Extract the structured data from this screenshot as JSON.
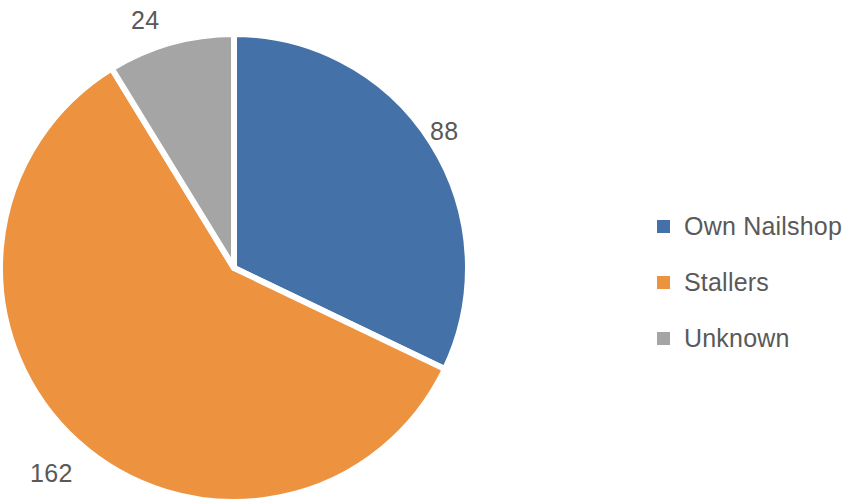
{
  "chart_data": {
    "type": "pie",
    "title": "",
    "subtitle": "",
    "xlabel": "",
    "ylabel": "",
    "categories": [
      "Own Nailshop",
      "Stallers",
      "Unknown"
    ],
    "values": [
      88,
      162,
      24
    ],
    "total": 274,
    "data_labels": [
      "88",
      "162",
      "24"
    ],
    "colors": [
      "#4472a8",
      "#ed9340",
      "#a5a5a5"
    ],
    "legend_position": "right",
    "grid": false,
    "start_angle_deg": 0,
    "direction": "clockwise",
    "slices": [
      {
        "name": "Own Nailshop",
        "value": 88,
        "label": "88",
        "color": "#4472a8",
        "percent": 32.1,
        "start_deg": 0,
        "end_deg": 115.6
      },
      {
        "name": "Stallers",
        "value": 162,
        "label": "162",
        "color": "#ed9340",
        "percent": 59.1,
        "start_deg": 115.6,
        "end_deg": 328.5
      },
      {
        "name": "Unknown",
        "value": 24,
        "label": "24",
        "color": "#a5a5a5",
        "percent": 8.8,
        "start_deg": 328.5,
        "end_deg": 360
      }
    ]
  },
  "legend": {
    "items": [
      {
        "label": "Own Nailshop",
        "color": "#4472a8"
      },
      {
        "label": "Stallers",
        "color": "#ed9340"
      },
      {
        "label": "Unknown",
        "color": "#a5a5a5"
      }
    ]
  },
  "labels": {
    "own_nailshop": "88",
    "stallers": "162",
    "unknown": "24"
  },
  "colors": {
    "background": "#ffffff",
    "text": "#595959",
    "slice_border": "#ffffff",
    "series_1": "#4472a8",
    "series_2": "#ed9340",
    "series_3": "#a5a5a5"
  }
}
